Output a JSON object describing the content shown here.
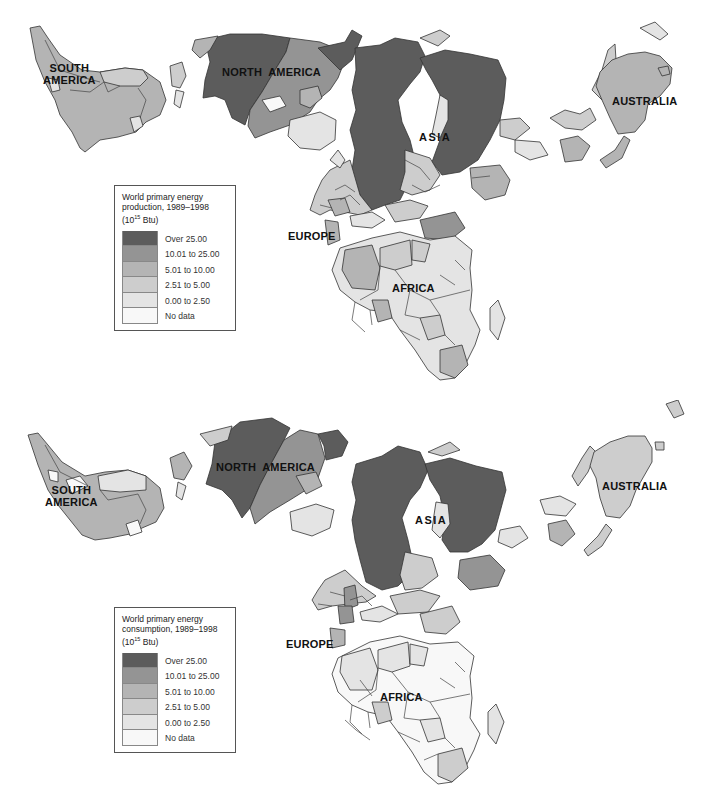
{
  "colors": {
    "over_25": "#5c5c5c",
    "c10_25": "#949494",
    "c5_10": "#b4b4b4",
    "c2_5": "#cdcdcd",
    "c0_2": "#e4e4e4",
    "no_data": "#f8f8f8"
  },
  "maps": [
    {
      "id": "production",
      "legend": {
        "title_line1": "World primary energy",
        "title_line2": "production, 1989–1998",
        "unit_prefix": "(10",
        "unit_exp": "15",
        "unit_suffix": " Btu)",
        "items": [
          {
            "label": "Over 25.00",
            "color": "#5c5c5c"
          },
          {
            "label": "10.01 to 25.00",
            "color": "#949494"
          },
          {
            "label": "5.01 to 10.00",
            "color": "#b4b4b4"
          },
          {
            "label": "2.51 to 5.00",
            "color": "#cdcdcd"
          },
          {
            "label": "0.00 to 2.50",
            "color": "#e4e4e4"
          },
          {
            "label": "No data",
            "color": "#f8f8f8"
          }
        ]
      },
      "regions": {
        "south_america": {
          "label_line1": "SOUTH",
          "label_line2": "AMERICA"
        },
        "north_america": {
          "label": "NORTH  AMERICA"
        },
        "asia": {
          "label": "ASIA"
        },
        "australia": {
          "label": "AUSTRALIA"
        },
        "europe": {
          "label": "EUROPE"
        },
        "africa": {
          "label": "AFRICA"
        }
      }
    },
    {
      "id": "consumption",
      "legend": {
        "title_line1": "World primary energy",
        "title_line2": "consumption, 1989–1998",
        "unit_prefix": "(10",
        "unit_exp": "15",
        "unit_suffix": " Btu)",
        "items": [
          {
            "label": "Over 25.00",
            "color": "#5c5c5c"
          },
          {
            "label": "10.01 to 25.00",
            "color": "#949494"
          },
          {
            "label": "5.01 to 10.00",
            "color": "#b4b4b4"
          },
          {
            "label": "2.51 to 5.00",
            "color": "#cdcdcd"
          },
          {
            "label": "0.00 to 2.50",
            "color": "#e4e4e4"
          },
          {
            "label": "No data",
            "color": "#f8f8f8"
          }
        ]
      },
      "regions": {
        "south_america": {
          "label_line1": "SOUTH",
          "label_line2": "AMERICA"
        },
        "north_america": {
          "label": "NORTH  AMERICA"
        },
        "asia": {
          "label": "ASIA"
        },
        "australia": {
          "label": "AUSTRALIA"
        },
        "europe": {
          "label": "EUROPE"
        },
        "africa": {
          "label": "AFRICA"
        }
      }
    }
  ]
}
